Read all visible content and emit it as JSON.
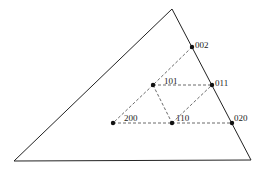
{
  "diagram": {
    "type": "ternary-simplex-lattice",
    "triangle": {
      "vertices": [
        [
          172,
          9
        ],
        [
          251,
          160
        ],
        [
          14,
          161
        ]
      ],
      "stroke": "#222222"
    },
    "points": [
      {
        "id": "002",
        "label": "002",
        "x": 192,
        "y": 47
      },
      {
        "id": "101",
        "label": "101",
        "x": 153,
        "y": 85
      },
      {
        "id": "011",
        "label": "011",
        "x": 212,
        "y": 85
      },
      {
        "id": "200",
        "label": "200",
        "x": 113,
        "y": 123
      },
      {
        "id": "110",
        "label": "110",
        "x": 172,
        "y": 123
      },
      {
        "id": "020",
        "label": "020",
        "x": 232,
        "y": 123
      }
    ],
    "dashed_edges": [
      [
        "002",
        "101"
      ],
      [
        "101",
        "200"
      ],
      [
        "200",
        "110"
      ],
      [
        "110",
        "020"
      ],
      [
        "101",
        "011"
      ],
      [
        "101",
        "110"
      ],
      [
        "110",
        "011"
      ]
    ],
    "colors": {
      "line": "#222222",
      "dashed": "#444444",
      "point": "#111111"
    }
  }
}
